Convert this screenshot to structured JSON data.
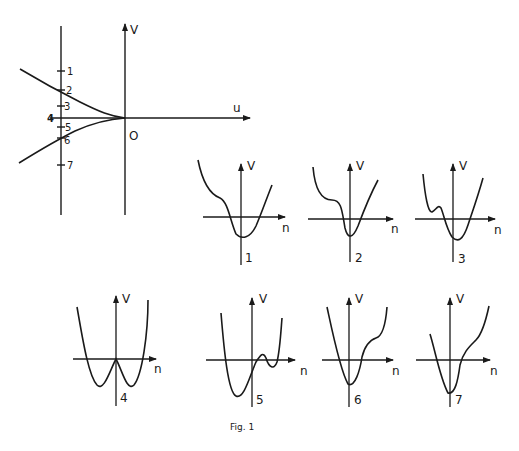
{
  "figure": {
    "caption": "Fig. 1",
    "ink_color": "#1a1a1a",
    "background": "#ffffff"
  },
  "main_plot": {
    "v_axis_label": "V",
    "u_axis_label": "u",
    "origin_label": "O",
    "ticks": [
      {
        "label": "1",
        "y": 71
      },
      {
        "label": "2",
        "y": 90
      },
      {
        "label": "3",
        "y": 106
      },
      {
        "label": "4",
        "y": 118
      },
      {
        "label": "5",
        "y": 127
      },
      {
        "label": "6",
        "y": 138
      },
      {
        "label": "7",
        "y": 165
      }
    ],
    "description": "Cusp-shaped bifurcation set in (u,V) plane; two branches meet tangentially at origin O; vertical line at u<0 crosses regions labelled 1-7"
  },
  "potential_plots": [
    {
      "id": "1",
      "x_label": "n",
      "y_label": "V",
      "shape": "single well with shoulder on left"
    },
    {
      "id": "2",
      "x_label": "n",
      "y_label": "V",
      "shape": "single well with inflection plateau on left"
    },
    {
      "id": "3",
      "x_label": "n",
      "y_label": "V",
      "shape": "main well with small metastable dip on left"
    },
    {
      "id": "4",
      "x_label": "n",
      "y_label": "V",
      "shape": "symmetric double well, maximum at origin"
    },
    {
      "id": "5",
      "x_label": "n",
      "y_label": "V",
      "shape": "deep left well, shallow right well"
    },
    {
      "id": "6",
      "x_label": "n",
      "y_label": "V",
      "shape": "single well with inflection plateau on right"
    },
    {
      "id": "7",
      "x_label": "n",
      "y_label": "V",
      "shape": "single well with shoulder on right"
    }
  ]
}
